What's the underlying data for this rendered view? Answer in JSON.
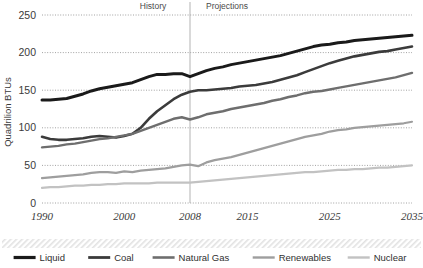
{
  "chart_data": {
    "type": "line",
    "title": "",
    "xlabel": "",
    "ylabel": "Quadrilion BTUs",
    "xlim": [
      1990,
      2035
    ],
    "ylim": [
      0,
      250
    ],
    "ytick_values": [
      0,
      50,
      100,
      150,
      200,
      250
    ],
    "ytick_labels": [
      "0",
      "50",
      "100",
      "150",
      "200",
      "250"
    ],
    "xtick_values": [
      1990,
      2000,
      2008,
      2015,
      2025,
      2035
    ],
    "xtick_labels": [
      "1990",
      "2000",
      "2008",
      "2015",
      "2025",
      "2035"
    ],
    "grid": "horizontal-dotted",
    "legend_position": "bottom",
    "annotations": [
      {
        "text": "History",
        "x": 2003.5,
        "y": 250,
        "name": "history-label"
      },
      {
        "text": "Projections",
        "x": 2012.5,
        "y": 250,
        "name": "projections-label"
      }
    ],
    "divider": {
      "x": 2008,
      "label": "history-projections-divider"
    },
    "x": [
      1990,
      1991,
      1992,
      1993,
      1994,
      1995,
      1996,
      1997,
      1998,
      1999,
      2000,
      2001,
      2002,
      2003,
      2004,
      2005,
      2006,
      2007,
      2008,
      2009,
      2010,
      2011,
      2012,
      2013,
      2014,
      2015,
      2016,
      2017,
      2018,
      2019,
      2020,
      2021,
      2022,
      2023,
      2024,
      2025,
      2026,
      2027,
      2028,
      2029,
      2030,
      2031,
      2032,
      2033,
      2034,
      2035
    ],
    "series": [
      {
        "name": "Liquid",
        "color": "#1a1a1a",
        "width": 3.0,
        "values": [
          137,
          137,
          138,
          139,
          142,
          145,
          149,
          152,
          154,
          156,
          158,
          160,
          164,
          168,
          171,
          171,
          172,
          172,
          168,
          172,
          176,
          179,
          181,
          184,
          186,
          188,
          190,
          192,
          194,
          196,
          199,
          202,
          205,
          208,
          210,
          211,
          213,
          214,
          216,
          217,
          218,
          219,
          220,
          221,
          222,
          223
        ]
      },
      {
        "name": "Coal",
        "color": "#3b3b3b",
        "width": 2.6,
        "values": [
          88,
          85,
          84,
          84,
          85,
          86,
          88,
          89,
          88,
          87,
          89,
          92,
          100,
          112,
          122,
          130,
          138,
          144,
          148,
          150,
          150,
          151,
          152,
          153,
          155,
          156,
          157,
          159,
          161,
          164,
          167,
          170,
          174,
          178,
          182,
          186,
          189,
          192,
          195,
          197,
          199,
          201,
          202,
          204,
          206,
          208
        ]
      },
      {
        "name": "Natural Gas",
        "color": "#6e6e6e",
        "width": 2.4,
        "values": [
          74,
          75,
          76,
          78,
          79,
          81,
          83,
          85,
          86,
          88,
          90,
          92,
          96,
          100,
          104,
          108,
          112,
          114,
          111,
          114,
          118,
          120,
          122,
          125,
          127,
          129,
          131,
          133,
          136,
          138,
          141,
          143,
          146,
          148,
          149,
          151,
          153,
          155,
          157,
          159,
          161,
          163,
          165,
          167,
          170,
          173
        ]
      },
      {
        "name": "Renewables",
        "color": "#9e9e9e",
        "width": 2.2,
        "values": [
          33,
          34,
          35,
          36,
          37,
          38,
          40,
          41,
          41,
          40,
          42,
          41,
          43,
          44,
          45,
          46,
          48,
          50,
          51,
          49,
          54,
          57,
          59,
          61,
          64,
          67,
          70,
          73,
          76,
          79,
          82,
          85,
          88,
          90,
          92,
          95,
          97,
          98,
          100,
          101,
          102,
          103,
          104,
          105,
          106,
          108
        ]
      },
      {
        "name": "Nuclear",
        "color": "#c2c2c2",
        "width": 2.2,
        "values": [
          20,
          21,
          21,
          22,
          23,
          23,
          24,
          24,
          25,
          25,
          26,
          26,
          26,
          26,
          27,
          27,
          27,
          27,
          27,
          28,
          29,
          30,
          31,
          32,
          33,
          34,
          35,
          36,
          37,
          38,
          39,
          40,
          41,
          41,
          42,
          43,
          44,
          44,
          45,
          45,
          46,
          47,
          47,
          48,
          49,
          50
        ]
      }
    ]
  },
  "legend": {
    "items": [
      {
        "label": "Liquid",
        "color": "#1a1a1a",
        "width": 3.2
      },
      {
        "label": "Coal",
        "color": "#3b3b3b",
        "width": 2.8
      },
      {
        "label": "Natural Gas",
        "color": "#6e6e6e",
        "width": 2.6
      },
      {
        "label": "Renewables",
        "color": "#9e9e9e",
        "width": 2.4
      },
      {
        "label": "Nuclear",
        "color": "#c2c2c2",
        "width": 2.4
      }
    ]
  }
}
